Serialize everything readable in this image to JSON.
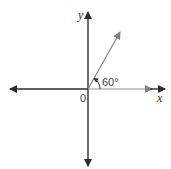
{
  "diagram": {
    "type": "angle-in-standard-position",
    "axes": {
      "x_label": "x",
      "y_label": "y",
      "origin_label": "0"
    },
    "angle": {
      "label": "60°",
      "degrees": 60
    },
    "colors": {
      "axis": "#2b2b2b",
      "ray": "#808080"
    }
  }
}
